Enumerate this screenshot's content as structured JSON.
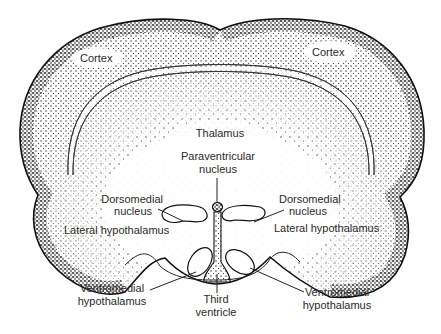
{
  "figure": {
    "colors": {
      "ink": "#111111",
      "text": "#2a2a2a",
      "background": "#ffffff"
    }
  },
  "labels": {
    "cortex_left": "Cortex",
    "cortex_right": "Cortex",
    "thalamus": "Thalamus",
    "paraventricular_line1": "Paraventricular",
    "paraventricular_line2": "nucleus",
    "dorsomedial_left_line1": "Dorsomedial",
    "dorsomedial_left_line2": "nucleus",
    "dorsomedial_right_line1": "Dorsomedial",
    "dorsomedial_right_line2": "nucleus",
    "lateral_hypothalamus_left": "Lateral hypothalamus",
    "lateral_hypothalamus_right": "Lateral hypothalamus",
    "ventromedial_left_line1": "Ventromedial",
    "ventromedial_left_line2": "hypothalamus",
    "ventromedial_right_line1": "Ventromedial",
    "ventromedial_right_line2": "hypothalamus",
    "third_ventricle_line1": "Third",
    "third_ventricle_line2": "ventricle"
  }
}
